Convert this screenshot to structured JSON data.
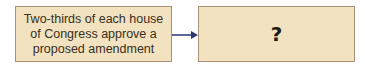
{
  "diagram": {
    "type": "flow",
    "nodes": [
      {
        "id": "step1",
        "text": "Two-thirds of each house of Congress approve a proposed amendment"
      },
      {
        "id": "step2",
        "text": "?"
      }
    ],
    "edges": [
      {
        "from": "step1",
        "to": "step2"
      }
    ],
    "colors": {
      "box_fill": "#f2e2bf",
      "box_border": "#a8927a",
      "arrow": "#2b3570"
    }
  }
}
